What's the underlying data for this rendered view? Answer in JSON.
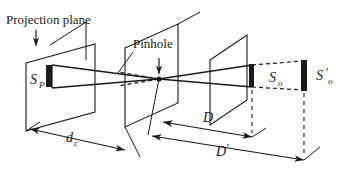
{
  "figure": {
    "background_color": "#ffffff",
    "ink_color": "#1a1a1a",
    "width": 348,
    "height": 176
  },
  "labels": {
    "projection_plane": "Projection plane",
    "pinhole": "Pinhole",
    "source_projection": "S",
    "source_projection_sub": "P",
    "object_near": "S",
    "object_near_sub": "o",
    "object_far": "S",
    "object_far_prime": "'",
    "object_far_sub": "o",
    "distance_dc": "d",
    "distance_dc_sub": "c",
    "distance_D": "D",
    "distance_Dprime": "D",
    "distance_Dprime_mark": "'"
  },
  "icons": {
    "arrow_down_projection": "down-arrow-icon",
    "arrow_down_pinhole": "down-arrow-icon"
  },
  "geometry": {
    "projection_plane_quad": "26,63 95,44 95,112 26,131",
    "pinhole_plane_quad": "125,48 178,24 178,103 125,127",
    "object_plane_quad": "210,60 247,35 247,100 210,125",
    "pinhole_point": {
      "x": 159,
      "y": 79,
      "r": 2.6
    },
    "sp_bar": {
      "x": 46,
      "y": 65,
      "w": 6,
      "h": 22
    },
    "so_bar": {
      "x": 249,
      "y": 65,
      "w": 5,
      "h": 22
    },
    "so_prime_bar": {
      "x": 301,
      "y": 62,
      "w": 6,
      "h": 28
    }
  }
}
